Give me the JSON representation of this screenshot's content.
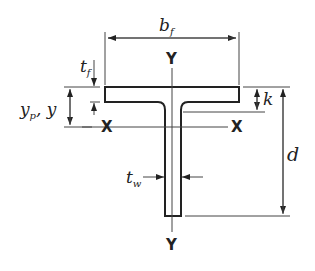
{
  "diagram": {
    "labels": {
      "flange_width": {
        "main": "b",
        "sub": "f"
      },
      "flange_thickness": {
        "main": "t",
        "sub": "f"
      },
      "web_thickness": {
        "main": "t",
        "sub": "w"
      },
      "depth": "d",
      "k_distance": "k",
      "centroid": {
        "main": "y",
        "sub": "p",
        "suffix": ", y"
      },
      "axis_x_left": "X",
      "axis_x_right": "X",
      "axis_y_top": "Y",
      "axis_y_bottom": "Y"
    },
    "colors": {
      "line": "#222222",
      "thin": "#444444",
      "background": "#ffffff"
    }
  }
}
